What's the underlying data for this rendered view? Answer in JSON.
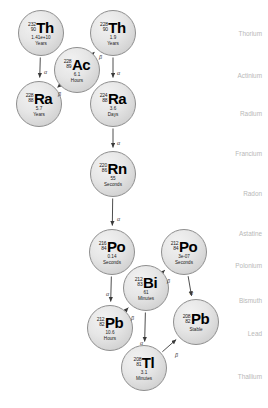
{
  "diagram": {
    "background": "#ffffff",
    "node_fill": "#e3e3e3",
    "node_stroke": "#8e8e8e",
    "arrow_color": "#444444",
    "element_label_color": "#b8b8b8"
  },
  "nodes": [
    {
      "id": "th232",
      "symbol": "Th",
      "mass": "232",
      "z": "90",
      "halflife": "1.41e+10",
      "unit": "Years",
      "cx": 41,
      "cy": 33,
      "r": 23
    },
    {
      "id": "th228",
      "symbol": "Th",
      "mass": "228",
      "z": "90",
      "halflife": "1.9",
      "unit": "Years",
      "cx": 113,
      "cy": 33,
      "r": 23
    },
    {
      "id": "ac228",
      "symbol": "Ac",
      "mass": "228",
      "z": "89",
      "halflife": "6.1",
      "unit": "Hours",
      "cx": 77,
      "cy": 70,
      "r": 23
    },
    {
      "id": "ra228",
      "symbol": "Ra",
      "mass": "228",
      "z": "88",
      "halflife": "5.7",
      "unit": "Years",
      "cx": 39,
      "cy": 104,
      "r": 23
    },
    {
      "id": "ra224",
      "symbol": "Ra",
      "mass": "224",
      "z": "88",
      "halflife": "3.6",
      "unit": "Days",
      "cx": 113,
      "cy": 104,
      "r": 23
    },
    {
      "id": "rn220",
      "symbol": "Rn",
      "mass": "220",
      "z": "86",
      "halflife": "55",
      "unit": "Seconds",
      "cx": 113,
      "cy": 174,
      "r": 23
    },
    {
      "id": "po216",
      "symbol": "Po",
      "mass": "216",
      "z": "84",
      "halflife": "0.14",
      "unit": "Seconds",
      "cx": 112,
      "cy": 252,
      "r": 23
    },
    {
      "id": "po212",
      "symbol": "Po",
      "mass": "212",
      "z": "84",
      "halflife": "3e-07",
      "unit": "Seconds",
      "cx": 184,
      "cy": 252,
      "r": 23
    },
    {
      "id": "bi212",
      "symbol": "Bi",
      "mass": "212",
      "z": "83",
      "halflife": "61",
      "unit": "Minutes",
      "cx": 146,
      "cy": 288,
      "r": 23
    },
    {
      "id": "pb212",
      "symbol": "Pb",
      "mass": "212",
      "z": "82",
      "halflife": "10.6",
      "unit": "Hours",
      "cx": 110,
      "cy": 328,
      "r": 23
    },
    {
      "id": "pb208",
      "symbol": "Pb",
      "mass": "208",
      "z": "82",
      "halflife": "Stable",
      "unit": "",
      "cx": 196,
      "cy": 322,
      "r": 23
    },
    {
      "id": "tl208",
      "symbol": "Tl",
      "mass": "208",
      "z": "81",
      "halflife": "3.1",
      "unit": "Minutes",
      "cx": 144,
      "cy": 368,
      "r": 23
    }
  ],
  "edges": [
    {
      "id": "th232-ra228",
      "from": "th232",
      "to": "ra228",
      "label": "α",
      "lx": 44,
      "ly": 69
    },
    {
      "id": "ra228-ac228",
      "from": "ra228",
      "to": "ac228",
      "label": "β",
      "lx": 58,
      "ly": 91
    },
    {
      "id": "ac228-th228",
      "from": "ac228",
      "to": "th228",
      "label": "β",
      "lx": 99,
      "ly": 54
    },
    {
      "id": "th228-ra224",
      "from": "th228",
      "to": "ra224",
      "label": "α",
      "lx": 117,
      "ly": 70
    },
    {
      "id": "ra224-rn220",
      "from": "ra224",
      "to": "rn220",
      "label": "α",
      "lx": 117,
      "ly": 140
    },
    {
      "id": "rn220-po216",
      "from": "rn220",
      "to": "po216",
      "label": "α",
      "lx": 117,
      "ly": 216
    },
    {
      "id": "po216-pb212",
      "from": "po216",
      "to": "pb212",
      "label": "α",
      "lx": 106,
      "ly": 291
    },
    {
      "id": "pb212-bi212",
      "from": "pb212",
      "to": "bi212",
      "label": "β",
      "lx": 131,
      "ly": 315
    },
    {
      "id": "bi212-po212",
      "from": "bi212",
      "to": "po212",
      "label": "β",
      "lx": 167,
      "ly": 278
    },
    {
      "id": "bi212-tl208",
      "from": "bi212",
      "to": "tl208",
      "label": "α",
      "lx": 140,
      "ly": 340
    },
    {
      "id": "po212-pb208",
      "from": "po212",
      "to": "pb208",
      "label": "α",
      "lx": 190,
      "ly": 290
    },
    {
      "id": "tl208-pb208",
      "from": "tl208",
      "to": "pb208",
      "label": "β",
      "lx": 175,
      "ly": 352
    }
  ],
  "element_labels": [
    {
      "name": "Thorium",
      "y": 30
    },
    {
      "name": "Actinium",
      "y": 72
    },
    {
      "name": "Radium",
      "y": 110
    },
    {
      "name": "Francium",
      "y": 150
    },
    {
      "name": "Radon",
      "y": 190
    },
    {
      "name": "Astatine",
      "y": 230
    },
    {
      "name": "Polonium",
      "y": 262
    },
    {
      "name": "Bismuth",
      "y": 297
    },
    {
      "name": "Lead",
      "y": 330
    },
    {
      "name": "Thallium",
      "y": 373
    }
  ]
}
